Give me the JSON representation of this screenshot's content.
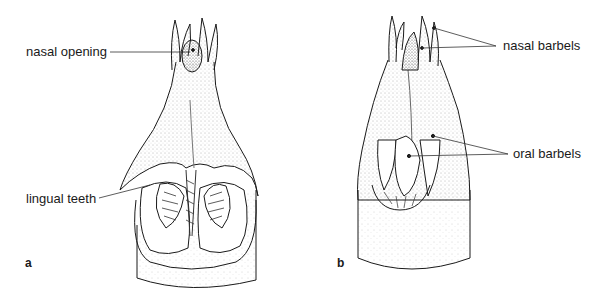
{
  "figure": {
    "panels": [
      {
        "id": "a",
        "label": "a",
        "annotations": [
          {
            "text": "nasal opening"
          },
          {
            "text": "lingual teeth"
          }
        ]
      },
      {
        "id": "b",
        "label": "b",
        "annotations": [
          {
            "text": "nasal barbels"
          },
          {
            "text": "oral barbels"
          }
        ]
      }
    ],
    "colors": {
      "ink": "#1a1a1a",
      "stipple": "#555555",
      "background": "#ffffff"
    }
  }
}
